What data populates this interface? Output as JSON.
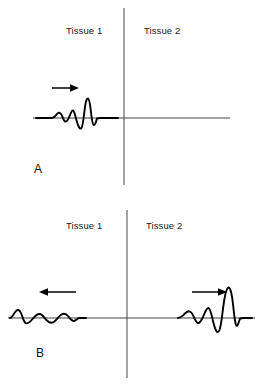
{
  "figure": {
    "background_color": "#ffffff",
    "line_color": "#000000",
    "axis_color": "#444444"
  },
  "panels": [
    {
      "letter": "A",
      "caption": "Incident pulse travelling toward the interface in Tissue 1",
      "left_region_label": "Tissue 1",
      "right_region_label": "Tissue 2",
      "arrows": [
        {
          "name": "incident-arrow",
          "direction": "right",
          "region": "Tissue 1"
        }
      ],
      "pulses": [
        {
          "name": "incident-pulse",
          "region": "Tissue 1",
          "amplitude": "large",
          "direction": "right"
        }
      ]
    },
    {
      "letter": "B",
      "caption": "Reflected pulse in Tissue 1 and transmitted pulse in Tissue 2",
      "left_region_label": "Tissue 1",
      "right_region_label": "Tissue 2",
      "arrows": [
        {
          "name": "reflected-arrow",
          "direction": "left",
          "region": "Tissue 1"
        },
        {
          "name": "transmitted-arrow",
          "direction": "right",
          "region": "Tissue 2"
        }
      ],
      "pulses": [
        {
          "name": "reflected-pulse",
          "region": "Tissue 1",
          "amplitude": "small",
          "direction": "left"
        },
        {
          "name": "transmitted-pulse",
          "region": "Tissue 2",
          "amplitude": "large",
          "direction": "right"
        }
      ]
    }
  ]
}
